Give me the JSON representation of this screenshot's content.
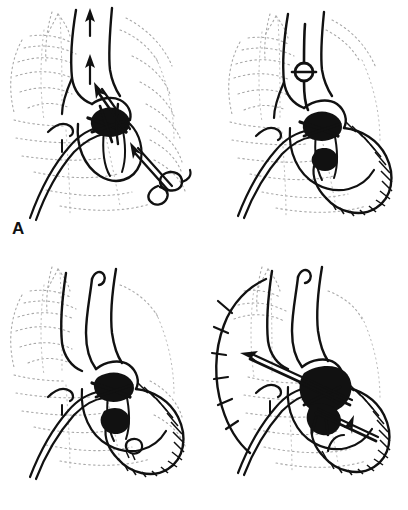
{
  "figure": {
    "background_color": "#ffffff",
    "ink_color": "#111111",
    "ghost_color": "#a9a9a9",
    "panel_count": 4
  },
  "panels": [
    {
      "id": "A",
      "label": "A",
      "position": "top-left",
      "description": "Great vessels with two upward flow arrows; central heart with dense black valve region; long arrow directed up-left into the ascending vessel; small looped cannula at lower right with arrow pointing up-left toward the heart.",
      "features": {
        "flow_arrows_up": 2,
        "inflow_arrow": 1,
        "cannula_loop": 1,
        "hatched_ventricle": false,
        "vessel_clamp": false,
        "vessel_count": 2
      }
    },
    {
      "id": "B",
      "label": "B",
      "position": "top-right",
      "description": "Vessel occluded by a circular clamp with a transverse bar; heart shown with a large hatched, thickened ventricular wall curving to the right and inferiorly.",
      "features": {
        "flow_arrows_up": 0,
        "inflow_arrow": 0,
        "cannula_loop": 0,
        "hatched_ventricle": true,
        "vessel_clamp": true,
        "vessel_count": 2
      }
    },
    {
      "id": "C",
      "label": "C",
      "position": "bottom-left",
      "description": "Three great vessels, the middle one with a hooked superior end; hatched ventricular wall; no flow arrows; small looped structure at the inferior heart border.",
      "features": {
        "flow_arrows_up": 0,
        "inflow_arrow": 0,
        "cannula_loop": 1,
        "hatched_ventricle": true,
        "vessel_clamp": false,
        "vessel_count": 3
      }
    },
    {
      "id": "D",
      "label": "D",
      "position": "bottom-right",
      "description": "Enlarged cardiac silhouette outlined on the left with tick marks; two heavy arrows crossing the heart — one long arrow pointing up-left and one shorter arrow pointing right into the hatched ventricular wall; densely filled black central valve region.",
      "features": {
        "flow_arrows_up": 0,
        "inflow_arrow": 2,
        "cannula_loop": 0,
        "hatched_ventricle": true,
        "vessel_clamp": false,
        "vessel_count": 3
      }
    }
  ]
}
